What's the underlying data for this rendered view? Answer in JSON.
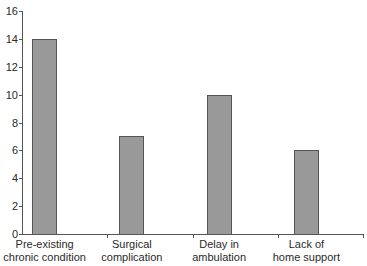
{
  "chart_data": {
    "type": "bar",
    "title": "",
    "xlabel": "",
    "ylabel": "",
    "categories": [
      "Pre-existing chronic condition",
      "Surgical complication",
      "Delay in ambulation",
      "Lack of home support"
    ],
    "category_lines": [
      [
        "Pre-existing",
        "chronic condition"
      ],
      [
        "Surgical",
        "complication"
      ],
      [
        "Delay in",
        "ambulation"
      ],
      [
        "Lack of",
        "home support"
      ]
    ],
    "values": [
      14,
      7,
      10,
      6
    ],
    "ylim": [
      0,
      16
    ],
    "yticks": [
      0,
      2,
      4,
      6,
      8,
      10,
      12,
      14,
      16
    ],
    "grid": false,
    "legend": null,
    "bar_color": "#999999",
    "bar_edge_color": "#555555"
  }
}
